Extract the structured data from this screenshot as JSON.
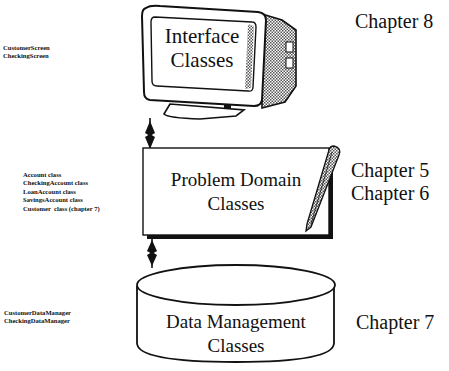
{
  "layers": [
    {
      "id": "interface",
      "title_line1": "Interface",
      "title_line2": "Classes",
      "shape": "monitor",
      "chapter": "Chapter 8",
      "classes": [
        "CustomerScreen",
        "CheckingScreen"
      ]
    },
    {
      "id": "problem-domain",
      "title_line1": "Problem Domain",
      "title_line2": "Classes",
      "shape": "notepad-with-pencil",
      "chapters": [
        "Chapter 5",
        "Chapter 6"
      ],
      "classes": [
        "Account class",
        "CheckingAccount class",
        "LoanAccount class",
        "SavingsAccount class",
        "Customer  class (chapter 7)"
      ]
    },
    {
      "id": "data-management",
      "title_line1": "Data Management",
      "title_line2": "Classes",
      "shape": "database-cylinder",
      "chapter": "Chapter 7",
      "classes": [
        "CustomerDataManager",
        "CheckingDataManager"
      ]
    }
  ],
  "connectors": [
    {
      "from": "interface",
      "to": "problem-domain",
      "type": "bidirectional-arrow"
    },
    {
      "from": "problem-domain",
      "to": "data-management",
      "type": "bidirectional-arrow"
    }
  ],
  "colors": {
    "ink": "#111111",
    "background": "#ffffff",
    "shade": "#9a9a9a"
  }
}
